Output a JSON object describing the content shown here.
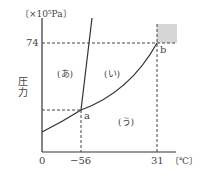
{
  "diagram": {
    "y_unit": "〔×10⁵Pa〕",
    "y_label": "圧力",
    "x_unit": "〔℃〕",
    "ticks": {
      "y_74": "74",
      "x_0": "0",
      "x_minus56": "−56",
      "x_31": "31"
    },
    "points": {
      "a": "a",
      "b": "b"
    },
    "regions": {
      "solid": "(あ)",
      "liquid": "(い)",
      "gas": "(う)"
    },
    "colors": {
      "line": "#333333",
      "dash": "#444444",
      "supercritical_box": "#d6d6d6"
    }
  }
}
